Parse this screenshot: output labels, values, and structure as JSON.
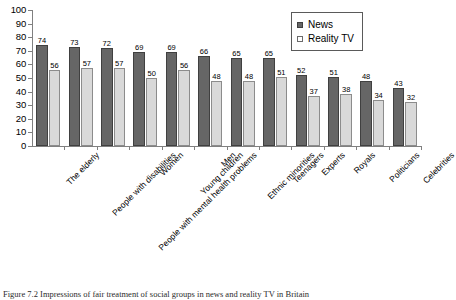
{
  "chart_data": {
    "type": "bar",
    "title": "",
    "xlabel": "",
    "ylabel": "",
    "ylim": [
      0,
      100
    ],
    "ytick_step": 10,
    "yticks": [
      0,
      10,
      20,
      30,
      40,
      50,
      60,
      70,
      80,
      90,
      100
    ],
    "grid": false,
    "legend_position": "top-right",
    "value_labels": true,
    "categories": [
      "The elderly",
      "People with disabilities",
      "People with mental health problems",
      "Women",
      "Young children",
      "Men",
      "Ethnic minorities",
      "Teenagers",
      "Experts",
      "Royals",
      "Politicians",
      "Celebrities"
    ],
    "series": [
      {
        "name": "News",
        "color": "#666666",
        "values": [
          74,
          73,
          72,
          69,
          69,
          66,
          65,
          65,
          52,
          51,
          48,
          43
        ]
      },
      {
        "name": "Reality TV",
        "color": "#d9d9d9",
        "values": [
          56,
          57,
          57,
          50,
          56,
          48,
          48,
          51,
          37,
          38,
          34,
          32
        ]
      }
    ]
  },
  "legend": {
    "items": [
      {
        "label": "News",
        "swatch": "news"
      },
      {
        "label": "Reality TV",
        "swatch": "reality"
      }
    ]
  },
  "caption": {
    "text": "Figure 7.2 Impressions of fair treatment of social groups in news and reality TV in Britain"
  },
  "colors": {
    "news": "#666666",
    "reality_tv": "#d9d9d9",
    "axis": "#808080",
    "text": "#000000",
    "background": "#ffffff"
  }
}
